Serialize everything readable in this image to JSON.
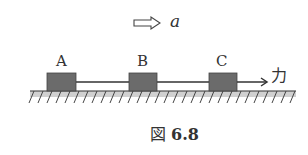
{
  "figure": {
    "acceleration_label": "a",
    "force_label": "力",
    "blocks": [
      {
        "label": "A"
      },
      {
        "label": "B"
      },
      {
        "label": "C"
      }
    ],
    "caption": {
      "prefix": "図",
      "number": "6.8"
    }
  },
  "colors": {
    "block_fill": "#6b6b6b",
    "ground_fill": "#c8c8c8",
    "line": "#333333"
  }
}
